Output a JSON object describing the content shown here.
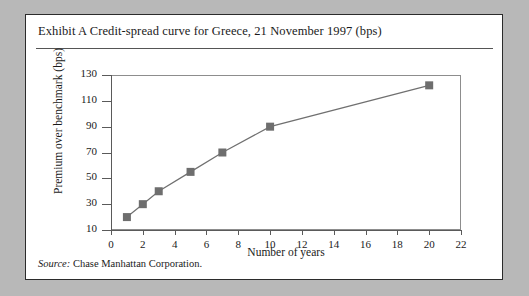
{
  "exhibit": {
    "title": "Exhibit A  Credit-spread curve for Greece, 21 November 1997 (bps)",
    "source_label": "Source:",
    "source_text": " Chase Manhattan Corporation."
  },
  "colors": {
    "page_background": "#b8b8b8",
    "panel_background": "#ffffff",
    "frame_border": "#2b2b2b",
    "axis": "#5a5a5a",
    "series_line": "#707070",
    "marker_fill": "#6e6e6e",
    "text": "#1a1a1a"
  },
  "chart_data": {
    "type": "line",
    "title": "Exhibit A  Credit-spread curve for Greece, 21 November 1997 (bps)",
    "xlabel": "Number of years",
    "ylabel": "Premium over benchmark (bps)",
    "xlim": [
      0,
      22
    ],
    "ylim": [
      10,
      130
    ],
    "xticks": [
      0,
      2,
      4,
      6,
      8,
      10,
      12,
      14,
      16,
      18,
      20,
      22
    ],
    "xtick_labels": [
      "0",
      "2",
      "4",
      "6",
      "8",
      "10",
      "12",
      "14",
      "16",
      "18",
      "20",
      "22"
    ],
    "yticks": [
      10,
      30,
      50,
      70,
      90,
      110,
      130
    ],
    "ytick_labels": [
      "10",
      "30",
      "50",
      "70",
      "90",
      "110",
      "130"
    ],
    "grid": false,
    "legend": null,
    "marker": "square",
    "series": [
      {
        "name": "Credit spread",
        "x": [
          1,
          2,
          3,
          5,
          7,
          10,
          20
        ],
        "values": [
          20,
          30,
          40,
          55,
          70,
          90,
          122
        ]
      }
    ]
  }
}
